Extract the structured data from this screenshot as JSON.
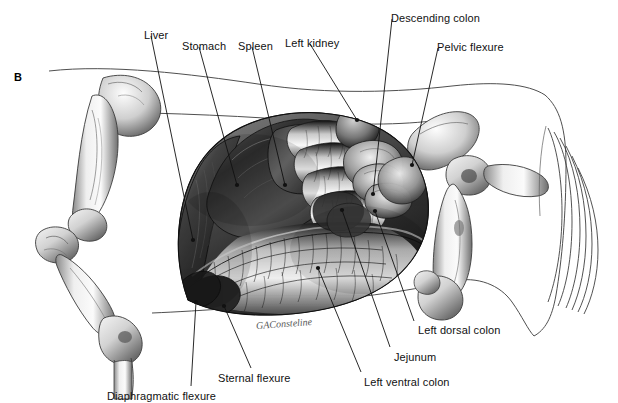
{
  "figure": {
    "panel_letter": "B",
    "signature": "GAConsteline",
    "background_color": "#ffffff",
    "ink_color": "#111111",
    "outline_color": "#555555"
  },
  "labels": [
    {
      "id": "liver",
      "text": "Liver",
      "text_x": 144,
      "text_y": 30,
      "line": [
        [
          151,
          36
        ],
        [
          193,
          240
        ]
      ],
      "dot": [
        193,
        240
      ]
    },
    {
      "id": "stomach",
      "text": "Stomach",
      "text_x": 182,
      "text_y": 41,
      "line": [
        [
          199,
          47
        ],
        [
          237,
          185
        ]
      ],
      "dot": [
        237,
        185
      ]
    },
    {
      "id": "spleen",
      "text": "Spleen",
      "text_x": 238,
      "text_y": 41,
      "line": [
        [
          252,
          47
        ],
        [
          285,
          185
        ]
      ],
      "dot": [
        285,
        185
      ]
    },
    {
      "id": "left-kidney",
      "text": "Left kidney",
      "text_x": 285,
      "text_y": 38,
      "line": [
        [
          310,
          44
        ],
        [
          357,
          120
        ]
      ],
      "dot": [
        357,
        120
      ]
    },
    {
      "id": "descending-colon",
      "text": "Descending colon",
      "text_x": 391,
      "text_y": 13,
      "line": [
        [
          392,
          19
        ],
        [
          373,
          194
        ]
      ],
      "dot": [
        373,
        194
      ]
    },
    {
      "id": "pelvic-flexure",
      "text": "Pelvic flexure",
      "text_x": 437,
      "text_y": 42,
      "line": [
        [
          438,
          48
        ],
        [
          412,
          165
        ]
      ],
      "dot": [
        412,
        165
      ]
    },
    {
      "id": "left-dorsal-colon",
      "text": "Left dorsal colon",
      "text_x": 418,
      "text_y": 325,
      "line": [
        [
          414,
          321
        ],
        [
          375,
          211
        ]
      ],
      "dot": [
        375,
        211
      ]
    },
    {
      "id": "jejunum",
      "text": "Jejunum",
      "text_x": 394,
      "text_y": 352,
      "line": [
        [
          390,
          347
        ],
        [
          342,
          210
        ]
      ],
      "dot": [
        342,
        210
      ]
    },
    {
      "id": "left-ventral-colon",
      "text": "Left ventral colon",
      "text_x": 364,
      "text_y": 377,
      "line": [
        [
          361,
          372
        ],
        [
          318,
          268
        ]
      ],
      "dot": [
        318,
        268
      ]
    },
    {
      "id": "sternal-flexure",
      "text": "Sternal flexure",
      "text_x": 218,
      "text_y": 373,
      "line": [
        [
          251,
          368
        ],
        [
          224,
          306
        ]
      ],
      "dot": [
        224,
        306
      ]
    },
    {
      "id": "diaphragmatic-flexure",
      "text": "Diaphragmatic flexure",
      "text_x": 107,
      "text_y": 391,
      "line": [
        [
          191,
          386
        ],
        [
          196,
          302
        ]
      ],
      "dot": [
        196,
        302
      ]
    }
  ],
  "illustration": {
    "title": "Equine abdominal viscera, left lateral view",
    "technique": "graphite / carbon-dust medical illustration",
    "structures": [
      "liver",
      "stomach",
      "spleen",
      "left kidney",
      "descending colon",
      "pelvic flexure",
      "left dorsal colon",
      "left ventral colon",
      "jejunum",
      "sternal flexure",
      "diaphragmatic flexure",
      "scapula",
      "humerus",
      "radius",
      "ulna",
      "carpus",
      "metacarpus",
      "pelvis",
      "femur",
      "tibia",
      "tail"
    ]
  }
}
